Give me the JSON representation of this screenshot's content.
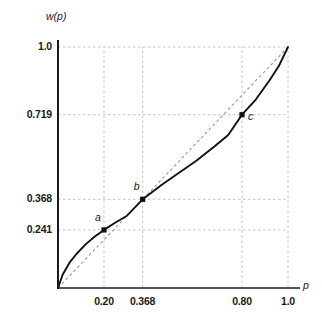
{
  "chart_data": {
    "type": "line",
    "title": "",
    "xlabel": "p",
    "ylabel": "w(p)",
    "xlim": [
      0,
      1.0
    ],
    "ylim": [
      0,
      1.0
    ],
    "grid": true,
    "legend": "none",
    "xticks": [
      {
        "value": 0.2,
        "label": "0.20"
      },
      {
        "value": 0.368,
        "label": "0.368"
      },
      {
        "value": 0.8,
        "label": "0.80"
      },
      {
        "value": 1.0,
        "label": "1.0"
      }
    ],
    "yticks": [
      {
        "value": 0.241,
        "label": "0.241"
      },
      {
        "value": 0.368,
        "label": "0.368"
      },
      {
        "value": 0.719,
        "label": "0.719"
      },
      {
        "value": 1.0,
        "label": "1.0"
      }
    ],
    "series": [
      {
        "name": "weighting-function",
        "style": "solid",
        "color": "#111111",
        "x": [
          0.0,
          0.02,
          0.05,
          0.08,
          0.12,
          0.16,
          0.2,
          0.25,
          0.3,
          0.368,
          0.45,
          0.52,
          0.6,
          0.68,
          0.74,
          0.8,
          0.86,
          0.92,
          0.96,
          1.0
        ],
        "y": [
          0.0,
          0.055,
          0.105,
          0.141,
          0.181,
          0.214,
          0.241,
          0.272,
          0.3,
          0.368,
          0.427,
          0.474,
          0.527,
          0.587,
          0.635,
          0.719,
          0.782,
          0.862,
          0.921,
          1.0
        ]
      },
      {
        "name": "identity-diagonal",
        "style": "dashed",
        "color": "#9a9a9a",
        "x": [
          0.0,
          1.0
        ],
        "y": [
          0.0,
          1.0
        ]
      }
    ],
    "points": [
      {
        "label": "a",
        "x": 0.2,
        "y": 0.241,
        "label_pos": "above-left"
      },
      {
        "label": "b",
        "x": 0.368,
        "y": 0.368,
        "label_pos": "above-left"
      },
      {
        "label": "c",
        "x": 0.8,
        "y": 0.719,
        "label_pos": "right"
      }
    ],
    "annotations": []
  },
  "axes": {
    "y_title": "w(p)",
    "x_title": "p"
  },
  "colors": {
    "curve": "#111111",
    "diagonal": "#9a9a9a",
    "grid": "#b5b5b5",
    "axis": "#1a1a1a",
    "background": "#ffffff"
  }
}
